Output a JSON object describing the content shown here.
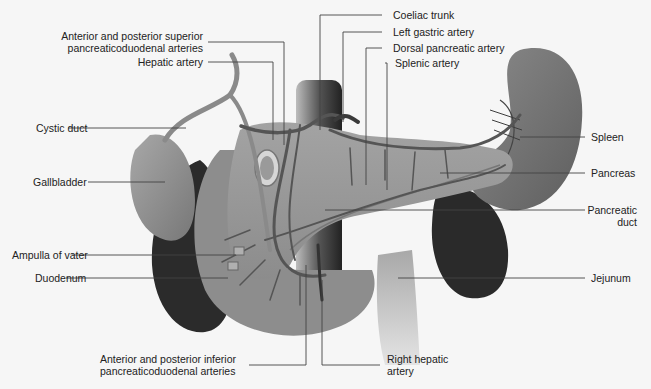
{
  "diagram": {
    "colors": {
      "background": "#f6f6f6",
      "organ_light": "#9a9a9a",
      "organ_mid": "#7d7d7d",
      "organ_dark": "#2e2e2e",
      "vessel": "#5a5a5a",
      "leader_line": "#444444",
      "label_text": "#222222"
    },
    "labels": {
      "ant_post_superior": [
        "Anterior and posterior superior",
        "pancreaticoduodenal arteries"
      ],
      "hepatic_artery": "Hepatic artery",
      "cystic_duct": "Cystic duct",
      "gallbladder": "Gallbladder",
      "ampulla_of_vater": "Ampulla of vater",
      "duodenum": "Duodenum",
      "ant_post_inferior": [
        "Anterior and posterior inferior",
        "pancreaticoduodenal arteries"
      ],
      "coeliac_trunk": "Coeliac trunk",
      "left_gastric_artery": "Left gastric artery",
      "dorsal_pancreatic_artery": "Dorsal pancreatic artery",
      "splenic_artery": "Splenic artery",
      "spleen": "Spleen",
      "pancreas": "Pancreas",
      "pancreatic_duct": [
        "Pancreatic",
        "duct"
      ],
      "jejunum": "Jejunum",
      "right_hepatic_artery": [
        "Right hepatic",
        "artery"
      ]
    }
  }
}
